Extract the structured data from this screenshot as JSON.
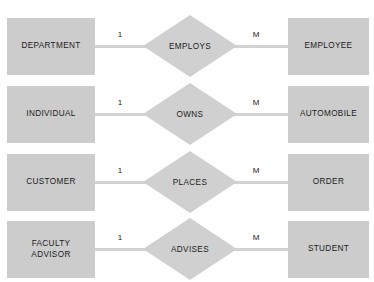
{
  "diagram": {
    "type": "entity-relationship-diagram",
    "notation": "Chen",
    "background_color": "#FFFFFF",
    "entity_fill_color": "#CCCCCC",
    "relationship_fill_color": "#D0D0D0",
    "connector_color": "#D2D2D2",
    "text_color": "#1B1B1B",
    "rows": [
      {
        "left_entity": "DEPARTMENT",
        "relationship": "EMPLOYS",
        "right_entity": "EMPLOYEE",
        "left_cardinality": "1",
        "right_cardinality": "M"
      },
      {
        "left_entity": "INDIVIDUAL",
        "relationship": "OWNS",
        "right_entity": "AUTOMOBILE",
        "left_cardinality": "1",
        "right_cardinality": "M"
      },
      {
        "left_entity": "CUSTOMER",
        "relationship": "PLACES",
        "right_entity": "ORDER",
        "left_cardinality": "1",
        "right_cardinality": "M"
      },
      {
        "left_entity": "FACULTY\nADVISOR",
        "relationship": "ADVISES",
        "right_entity": "STUDENT",
        "left_cardinality": "1",
        "right_cardinality": "M"
      }
    ]
  }
}
